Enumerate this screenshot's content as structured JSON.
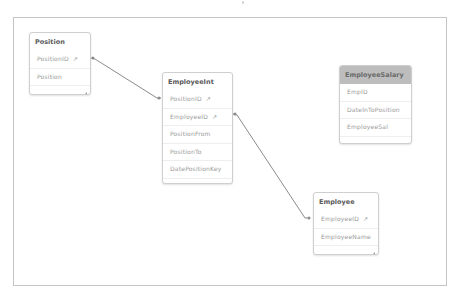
{
  "canvas": {
    "border_color": "#c4c4c4",
    "link_color": "#8c8c8c"
  },
  "tables": [
    {
      "name": "Position",
      "header_style": "normal",
      "fields": [
        {
          "label": "PositionID",
          "is_key": true
        },
        {
          "label": "Position",
          "is_key": false
        }
      ]
    },
    {
      "name": "EmployeeInt",
      "header_style": "normal",
      "fields": [
        {
          "label": "PositionID",
          "is_key": true
        },
        {
          "label": "EmployeeID",
          "is_key": true
        },
        {
          "label": "PositionFrom",
          "is_key": false
        },
        {
          "label": "PositionTo",
          "is_key": false
        },
        {
          "label": "DatePositionKey",
          "is_key": false
        }
      ]
    },
    {
      "name": "EmployeeSalary",
      "header_style": "disconnected",
      "header_color": "#bdbdbd",
      "fields": [
        {
          "label": "EmpID",
          "is_key": false
        },
        {
          "label": "DateInToPosition",
          "is_key": false
        },
        {
          "label": "EmployeeSal",
          "is_key": false
        }
      ]
    },
    {
      "name": "Employee",
      "header_style": "normal",
      "fields": [
        {
          "label": "EmployeeID",
          "is_key": true
        },
        {
          "label": "EmployeeName",
          "is_key": false
        }
      ]
    }
  ],
  "links": [
    {
      "from": "Position.PositionID",
      "to": "EmployeeInt.PositionID"
    },
    {
      "from": "EmployeeInt.EmployeeID",
      "to": "Employee.EmployeeID"
    }
  ],
  "icons": {
    "key": "↗"
  }
}
